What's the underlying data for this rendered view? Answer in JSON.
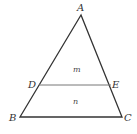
{
  "diagram": {
    "type": "triangle-with-parallel-segment",
    "line_color": "#333333",
    "segment_color": "#777777",
    "vertices": {
      "A": {
        "label": "A",
        "x": 81,
        "y": 15
      },
      "B": {
        "label": "B",
        "x": 20,
        "y": 117
      },
      "C": {
        "label": "C",
        "x": 122,
        "y": 117
      },
      "D": {
        "label": "D",
        "x": 39,
        "y": 85
      },
      "E": {
        "label": "E",
        "x": 111,
        "y": 85
      }
    },
    "regions": {
      "upper": {
        "label": "m"
      },
      "lower": {
        "label": "n"
      }
    }
  }
}
